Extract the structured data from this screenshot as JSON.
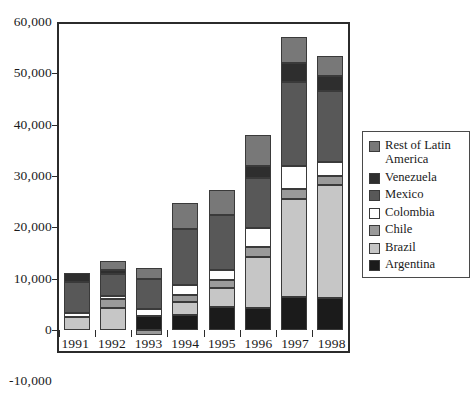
{
  "chart_data": {
    "type": "bar",
    "title": "",
    "subtitle": "",
    "xlabel": "",
    "ylabel": "",
    "stacked": true,
    "grid": false,
    "legend_position": "right",
    "categories": [
      "1991",
      "1992",
      "1993",
      "1994",
      "1995",
      "1996",
      "1997",
      "1998"
    ],
    "ylim": [
      -10000,
      60000
    ],
    "ytick_labels": [
      "60,000",
      "50,000",
      "40,000",
      "30,000",
      "20,000",
      "10,000",
      "0",
      "-10,000"
    ],
    "ytick_values": [
      60000,
      50000,
      40000,
      30000,
      20000,
      10000,
      0,
      -10000
    ],
    "series": [
      {
        "name": "Argentina",
        "color": "#1b1b1b",
        "values": [
          0,
          0,
          2800,
          3000,
          4400,
          4200,
          6500,
          6200
        ]
      },
      {
        "name": "Brazil",
        "color": "#c6c6c6",
        "values": [
          2600,
          4300,
          0,
          2400,
          3700,
          10100,
          19000,
          22100
        ]
      },
      {
        "name": "Chile",
        "color": "#9a9a9a",
        "values": [
          0,
          1700,
          -900,
          1500,
          1600,
          1900,
          2000,
          1700
        ]
      },
      {
        "name": "Colombia",
        "color": "#ffffff",
        "values": [
          700,
          700,
          1200,
          1800,
          2000,
          3700,
          4500,
          2800
        ]
      },
      {
        "name": "Mexico",
        "color": "#585858",
        "values": [
          6100,
          4200,
          6000,
          11000,
          10700,
          9800,
          16300,
          13700
        ]
      },
      {
        "name": "Venezuela",
        "color": "#2e2e2e",
        "values": [
          1700,
          700,
          0,
          0,
          0,
          2300,
          3700,
          3000
        ]
      },
      {
        "name": "Rest of Latin America",
        "color": "#787878",
        "values": [
          0,
          1800,
          2100,
          5100,
          4900,
          6000,
          5000,
          3900
        ]
      }
    ],
    "totals": [
      11100,
      13400,
      11200,
      24800,
      27300,
      38000,
      57000,
      53400
    ],
    "legend_order": [
      "Rest of Latin America",
      "Venezuela",
      "Mexico",
      "Colombia",
      "Chile",
      "Brazil",
      "Argentina"
    ]
  },
  "legend": {
    "items": [
      {
        "label": "Rest of Latin America",
        "color": "#787878"
      },
      {
        "label": "Venezuela",
        "color": "#2e2e2e"
      },
      {
        "label": "Mexico",
        "color": "#585858"
      },
      {
        "label": "Colombia",
        "color": "#ffffff"
      },
      {
        "label": "Chile",
        "color": "#9a9a9a"
      },
      {
        "label": "Brazil",
        "color": "#c6c6c6"
      },
      {
        "label": "Argentina",
        "color": "#1b1b1b"
      }
    ]
  }
}
